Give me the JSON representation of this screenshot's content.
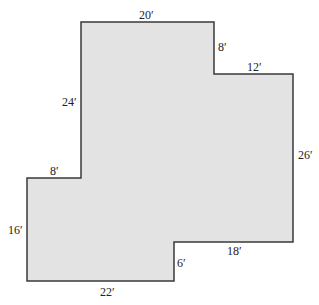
{
  "diagram": {
    "shape": "rectilinear-floor-plan",
    "fill_color": "#e3e3e3",
    "stroke_color": "#3a3a3a",
    "vertices": [
      [
        81,
        22
      ],
      [
        214,
        22
      ],
      [
        214,
        74
      ],
      [
        293,
        74
      ],
      [
        293,
        242
      ],
      [
        174,
        242
      ],
      [
        174,
        281
      ],
      [
        27,
        281
      ],
      [
        27,
        178
      ],
      [
        81,
        178
      ]
    ],
    "labels": {
      "top": "20′",
      "upper_step_vertical": "8′",
      "upper_step_horizontal": "12′",
      "right": "26′",
      "lower_step_horizontal": "18′",
      "lower_step_vertical": "6′",
      "bottom": "22′",
      "left_lower": "16′",
      "left_step_horizontal": "8′",
      "left_upper": "24′"
    }
  }
}
